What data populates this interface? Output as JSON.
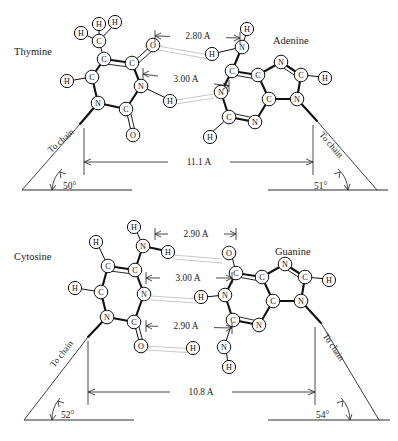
{
  "figure": {
    "background": "#ffffff",
    "ink": "#111111",
    "hbond_color": "#c9c9c9"
  },
  "atoms": {
    "C": "C",
    "N": "N",
    "O": "O",
    "H": "H"
  },
  "pairs": [
    {
      "id": "thymine-adenine",
      "left_base_label": "Thymine",
      "right_base_label": "Adenine",
      "span_label": "11.1 A",
      "left_chain_label": "To chain",
      "right_chain_label": "To chain",
      "left_angle_label": "50°",
      "right_angle_label": "51°",
      "hbonds": [
        {
          "label": "2.80 A",
          "donor": "N",
          "acceptor": "O"
        },
        {
          "label": "3.00 A",
          "donor": "N",
          "acceptor": "N"
        }
      ]
    },
    {
      "id": "cytosine-guanine",
      "left_base_label": "Cytosine",
      "right_base_label": "Guanine",
      "span_label": "10.8 A",
      "left_chain_label": "To chain",
      "right_chain_label": "To chain",
      "left_angle_label": "52°",
      "right_angle_label": "54°",
      "hbonds": [
        {
          "label": "2.90 A",
          "donor": "N",
          "acceptor": "O"
        },
        {
          "label": "3.00 A",
          "donor": "N",
          "acceptor": "N"
        },
        {
          "label": "2.90 A",
          "donor": "N",
          "acceptor": "O"
        }
      ]
    }
  ]
}
